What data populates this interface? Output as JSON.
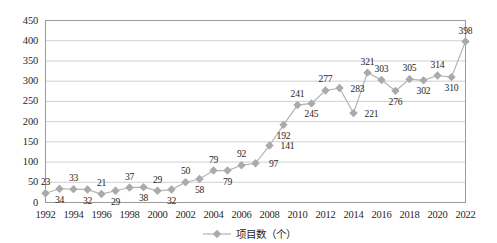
{
  "chart_data": {
    "type": "line",
    "title": "",
    "xlabel": "",
    "ylabel": "",
    "ylim": [
      0,
      450
    ],
    "ytick_step": 50,
    "yticks": [
      "0",
      "50",
      "100",
      "150",
      "200",
      "250",
      "300",
      "350",
      "400",
      "450"
    ],
    "grid": true,
    "legend_position": "bottom",
    "legend": [
      "项目数（个）"
    ],
    "series_name": "项目数（个）",
    "x": [
      1992,
      1993,
      1994,
      1995,
      1996,
      1997,
      1998,
      1999,
      2000,
      2001,
      2002,
      2003,
      2004,
      2005,
      2006,
      2007,
      2008,
      2009,
      2010,
      2011,
      2012,
      2013,
      2014,
      2015,
      2016,
      2017,
      2018,
      2019,
      2020,
      2021,
      2022
    ],
    "values": [
      23,
      34,
      33,
      32,
      21,
      29,
      37,
      38,
      29,
      32,
      50,
      58,
      79,
      79,
      92,
      97,
      141,
      192,
      241,
      245,
      277,
      283,
      221,
      321,
      303,
      276,
      305,
      302,
      314,
      310,
      398
    ],
    "point_labels": [
      "23",
      "34",
      "33",
      "32",
      "21",
      "29",
      "37",
      "38",
      "29",
      "32",
      "50",
      "58",
      "79",
      "79",
      "92",
      "97",
      "141",
      "192",
      "241",
      "245",
      "277",
      "283",
      "221",
      "321",
      "303",
      "276",
      "305",
      "302",
      "314",
      "310",
      "398"
    ],
    "label_positions": [
      "above",
      "below",
      "above",
      "below",
      "above",
      "below",
      "above",
      "below",
      "above",
      "below",
      "above",
      "below",
      "above",
      "below",
      "above",
      "right",
      "right",
      "below",
      "above",
      "below",
      "above",
      "right",
      "right",
      "above",
      "above",
      "below",
      "above",
      "below",
      "above",
      "below",
      "above"
    ],
    "xtick_labels": [
      "1992",
      "1994",
      "1996",
      "1998",
      "2000",
      "2002",
      "2004",
      "2006",
      "2008",
      "2010",
      "2012",
      "2014",
      "2016",
      "2018",
      "2020",
      "2022"
    ],
    "xticks": [
      1992,
      1994,
      1996,
      1998,
      2000,
      2002,
      2004,
      2006,
      2008,
      2010,
      2012,
      2014,
      2016,
      2018,
      2020,
      2022
    ],
    "colors": {
      "line": "#b3b3b3",
      "marker": "#aaaaaa",
      "grid": "#d0d0d0",
      "axis": "#9a9a9a",
      "text": "#1f1f1f",
      "background": "#ffffff"
    }
  }
}
